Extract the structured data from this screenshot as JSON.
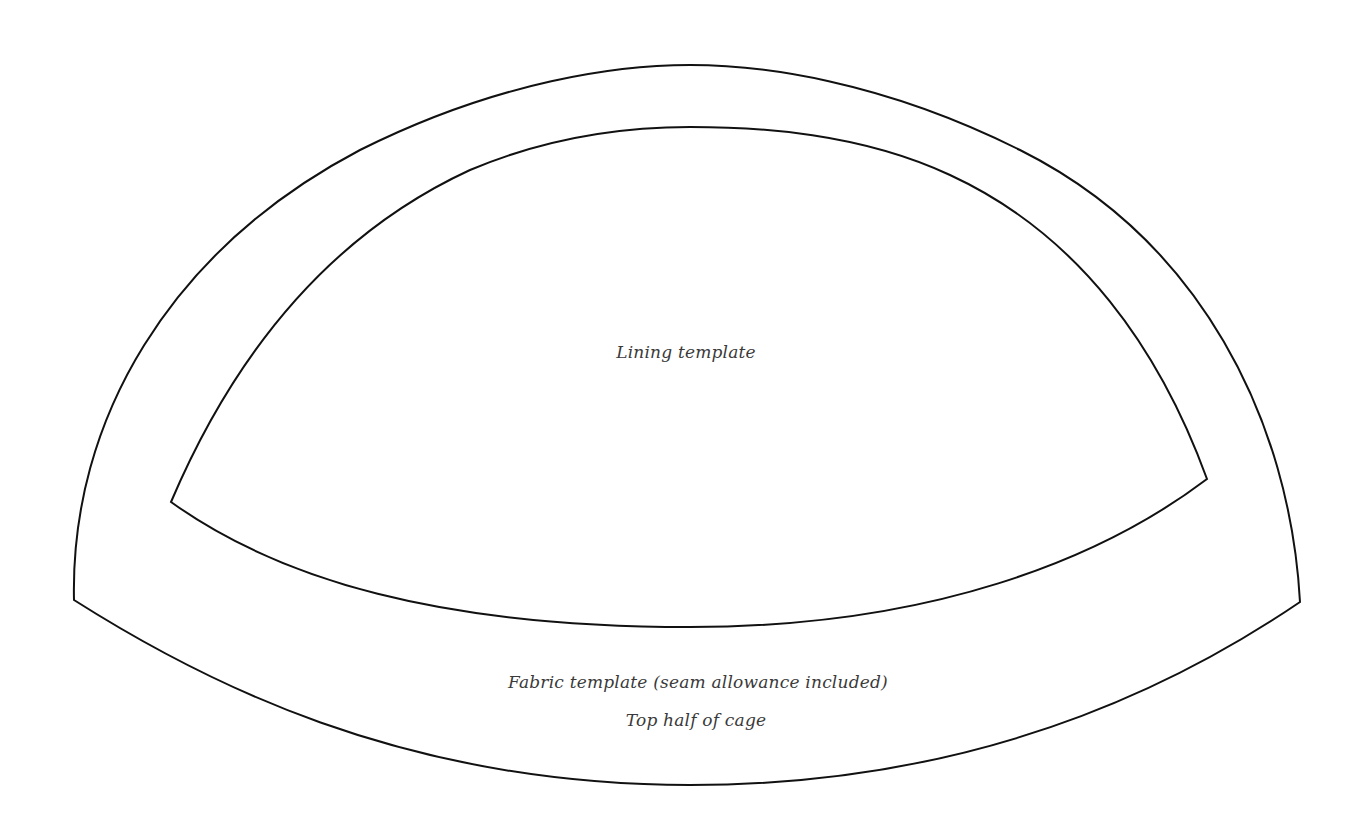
{
  "diagram": {
    "kind": "sewing pattern template",
    "stroke_color": "#111111",
    "text_color": "#3a3a3a",
    "background": "#ffffff",
    "shapes": {
      "outer": {
        "name": "Fabric template",
        "corners": {
          "bottom_left": [
            74,
            600
          ],
          "bottom_right": [
            1300,
            602
          ]
        },
        "top_y": 65,
        "bottom_y": 785
      },
      "inner": {
        "name": "Lining template",
        "corners": {
          "bottom_left": [
            171,
            502
          ],
          "bottom_right": [
            1207,
            479
          ]
        },
        "top_y": 127,
        "bottom_y": 627
      }
    },
    "labels": {
      "lining": "Lining template",
      "fabric": "Fabric template (seam allowance included)",
      "part": "Top half of cage"
    }
  }
}
